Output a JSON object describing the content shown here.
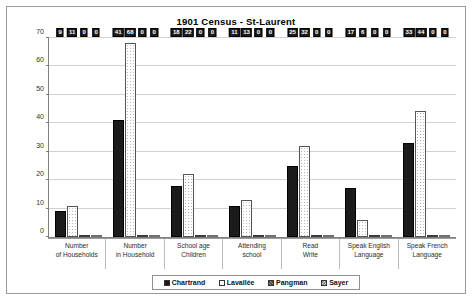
{
  "chart_data": {
    "type": "bar",
    "title": "1901 Census - St-Laurent",
    "xlabel": "",
    "ylabel": "",
    "ylim": [
      0,
      70
    ],
    "yticks": [
      0,
      10,
      20,
      30,
      40,
      50,
      60,
      70
    ],
    "grid": true,
    "legend_position": "bottom",
    "categories": [
      "Number of Households",
      "Number in Household",
      "School age Children",
      "Attending school",
      "Read Write",
      "Speak English Language",
      "Speak French Language"
    ],
    "category_lines": [
      [
        "Number",
        "of Households"
      ],
      [
        "Number",
        "in Household"
      ],
      [
        "School age",
        "Children"
      ],
      [
        "Attending",
        "school"
      ],
      [
        "Read",
        "Write"
      ],
      [
        "Speak English",
        "Language"
      ],
      [
        "Speak French",
        "Language"
      ]
    ],
    "series": [
      {
        "name": "Chartrand",
        "values": [
          9,
          41,
          18,
          11,
          25,
          17,
          33
        ]
      },
      {
        "name": "Lavallée",
        "values": [
          11,
          68,
          22,
          13,
          32,
          6,
          44
        ]
      },
      {
        "name": "Pangman",
        "values": [
          0,
          0,
          0,
          0,
          0,
          0,
          0
        ]
      },
      {
        "name": "Sayer",
        "values": [
          0,
          0,
          0,
          0,
          0,
          0,
          0
        ]
      }
    ]
  },
  "legend": {
    "items": [
      {
        "label": "Chartrand"
      },
      {
        "label": "Lavallée"
      },
      {
        "label": "Pangman"
      },
      {
        "label": "Sayer"
      }
    ]
  }
}
